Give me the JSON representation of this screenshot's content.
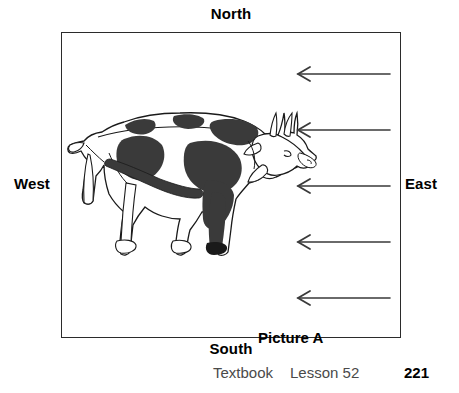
{
  "page": {
    "background_color": "#ffffff",
    "width": 459,
    "height": 393
  },
  "compass": {
    "north": "North",
    "south": "South",
    "west": "West",
    "east": "East",
    "text_color": "#000000"
  },
  "scene": {
    "caption": "Picture A",
    "border_color": "#2b2b2b",
    "fill_color": "#ffffff",
    "frame": {
      "x": 61,
      "y": 32,
      "width": 340,
      "height": 306
    }
  },
  "illustration": {
    "subject": "cow-illustration",
    "facing": "east",
    "outline_color": "#1a1a1a",
    "spot_color": "#3a3a3a",
    "body_color": "#ffffff"
  },
  "arrows": {
    "direction": "west",
    "count": 5,
    "color": "#3a3a3a",
    "tip_x": 297,
    "tail_x": 389,
    "rows": [
      73,
      129,
      185,
      241,
      297
    ]
  },
  "footer": {
    "textbook": "Textbook",
    "lesson": "Lesson 52",
    "page_number": "221",
    "text_color": "#4a4a4a",
    "page_number_color": "#000000"
  }
}
